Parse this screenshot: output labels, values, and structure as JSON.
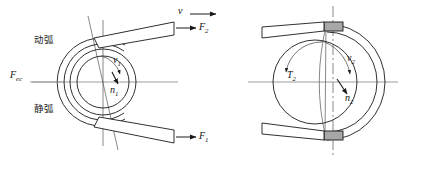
{
  "figure": {
    "title": "",
    "type": "engineering-schematic",
    "background_color": "#ffffff",
    "line_color": "#1a1a1a",
    "axis_color": "#9a9a9a",
    "pad_fill_color": "#a8a8a8"
  },
  "left_view": {
    "name": "left-view",
    "labels": {
      "moving_arc": "动弧",
      "static_arc": "静弧",
      "force_ec": "F",
      "force_ec_sub": "ec",
      "force_upper": "F",
      "force_upper_sub": "2",
      "force_lower": "F",
      "force_lower_sub": "1",
      "velocity_arc": "v",
      "velocity_arc_sub": "1",
      "rotation": "n",
      "rotation_sub": "1"
    }
  },
  "right_view": {
    "name": "right-view",
    "labels": {
      "velocity_top": "v",
      "velocity_arc": "v",
      "velocity_arc_sub": "2",
      "torque": "T",
      "torque_sub": "2",
      "rotation": "n",
      "rotation_sub": "2"
    }
  },
  "geometry": {
    "left": {
      "center_x": 103,
      "center_y": 82,
      "inner_radius": 26,
      "outer_radius": 33,
      "arc_outer_radius": 44,
      "arc_inner_radius": 38
    },
    "right": {
      "center_x": 315,
      "center_y": 82,
      "inner_radius": 42,
      "outer_radius": 50,
      "pad_width": 19,
      "pad_height": 8
    }
  }
}
